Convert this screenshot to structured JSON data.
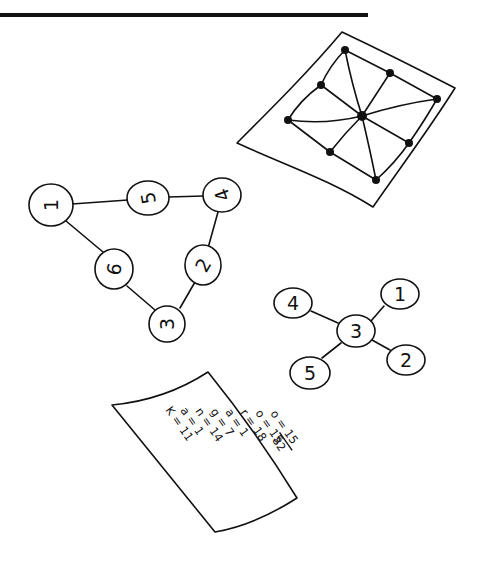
{
  "illustration": {
    "top_rule": {
      "x1": 0,
      "x2": 368,
      "y": 15
    },
    "map_sheet": {
      "outline": [
        [
          342,
          32
        ],
        [
          455,
          88
        ],
        [
          373,
          207
        ],
        [
          237,
          143
        ]
      ],
      "dots": [
        [
          345,
          50
        ],
        [
          390,
          73
        ],
        [
          437,
          99
        ],
        [
          321,
          85
        ],
        [
          362,
          116
        ],
        [
          288,
          120
        ],
        [
          409,
          143
        ],
        [
          330,
          152
        ],
        [
          376,
          180
        ]
      ],
      "center_dot": 4
    },
    "triangle_graph": {
      "nodes": [
        {
          "label": "1",
          "x": 51,
          "y": 205,
          "r": 21,
          "rotate": -90
        },
        {
          "label": "5",
          "x": 148,
          "y": 198,
          "r": 20,
          "rotate": -100
        },
        {
          "label": "4",
          "x": 222,
          "y": 195,
          "r": 18,
          "rotate": -110
        },
        {
          "label": "2",
          "x": 203,
          "y": 265,
          "r": 18,
          "rotate": -60
        },
        {
          "label": "6",
          "x": 114,
          "y": 269,
          "r": 19,
          "rotate": -80
        },
        {
          "label": "3",
          "x": 167,
          "y": 324,
          "r": 18,
          "rotate": -90
        }
      ],
      "edges": [
        [
          "1",
          "5"
        ],
        [
          "5",
          "4"
        ],
        [
          "4",
          "2"
        ],
        [
          "2",
          "3"
        ],
        [
          "3",
          "6"
        ],
        [
          "6",
          "1"
        ]
      ]
    },
    "star_graph": {
      "nodes": [
        {
          "label": "3",
          "x": 356,
          "y": 331,
          "r": 18
        },
        {
          "label": "4",
          "x": 293,
          "y": 303,
          "r": 18
        },
        {
          "label": "1",
          "x": 400,
          "y": 294,
          "r": 18
        },
        {
          "label": "2",
          "x": 406,
          "y": 360,
          "r": 18
        },
        {
          "label": "5",
          "x": 310,
          "y": 373,
          "r": 19
        }
      ],
      "edges": [
        [
          "3",
          "4"
        ],
        [
          "3",
          "1"
        ],
        [
          "3",
          "2"
        ],
        [
          "3",
          "5"
        ]
      ]
    },
    "list_sheet": {
      "entries": [
        {
          "letter": "K",
          "value": "11"
        },
        {
          "letter": "a",
          "value": "1"
        },
        {
          "letter": "n",
          "value": "14"
        },
        {
          "letter": "g",
          "value": "7"
        },
        {
          "letter": "a",
          "value": "1"
        },
        {
          "letter": "r",
          "value": "18"
        },
        {
          "letter": "o",
          "value": "15"
        },
        {
          "letter": "o",
          "value": "15"
        }
      ],
      "total": "82",
      "lines": {
        "l0": "K = 11",
        "l1": "a = 1",
        "l2": "n = 14",
        "l3": "g = 7",
        "l4": "a = 1",
        "l5": "r = 18",
        "l6": "o = 15",
        "l7": "o = 15",
        "total": "82"
      }
    }
  }
}
